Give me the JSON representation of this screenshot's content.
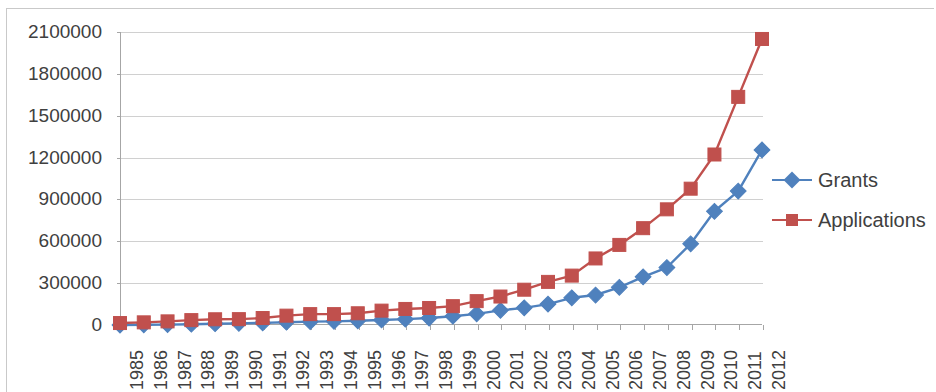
{
  "chart_data": {
    "type": "line",
    "title": "",
    "subtitle": "",
    "xlabel": "",
    "ylabel": "",
    "grid": true,
    "legend_position": "right",
    "xlim": [
      "1985",
      "2012"
    ],
    "ylim": [
      0,
      2100000
    ],
    "ytick_step": 300000,
    "categories": [
      "1985",
      "1986",
      "1987",
      "1988",
      "1989",
      "1990",
      "1991",
      "1992",
      "1993",
      "1994",
      "1995",
      "1996",
      "1997",
      "1998",
      "1999",
      "2000",
      "2001",
      "2002",
      "2003",
      "2004",
      "2005",
      "2006",
      "2007",
      "2008",
      "2009",
      "2010",
      "2011",
      "2012"
    ],
    "ytick_labels": [
      "0",
      "300000",
      "600000",
      "900000",
      "1200000",
      "1500000",
      "1800000",
      "2100000"
    ],
    "ytick_values": [
      0,
      300000,
      600000,
      900000,
      1200000,
      1500000,
      1800000,
      2100000
    ],
    "series": [
      {
        "name": "Grants",
        "color": "#4F81BD",
        "marker": "diamond",
        "values": [
          1,
          1500,
          3000,
          5500,
          9000,
          12000,
          15000,
          20000,
          24000,
          26000,
          30000,
          36000,
          42000,
          50000,
          63000,
          80000,
          105000,
          123000,
          150000,
          195000,
          215000,
          270000,
          345000,
          412000,
          582000,
          815000,
          960000,
          1255000
        ]
      },
      {
        "name": "Applications",
        "color": "#C0504D",
        "marker": "square",
        "values": [
          14000,
          19000,
          26000,
          35000,
          41000,
          42000,
          50000,
          67000,
          78000,
          78000,
          84000,
          103000,
          115000,
          122000,
          135000,
          171000,
          204000,
          253000,
          309000,
          354000,
          477000,
          574000,
          694000,
          829000,
          977000,
          1222000,
          1635000,
          2050000
        ]
      }
    ]
  },
  "legend": {
    "items": [
      {
        "label": "Grants",
        "color": "#4F81BD",
        "marker": "diamond"
      },
      {
        "label": "Applications",
        "color": "#C0504D",
        "marker": "square"
      }
    ]
  }
}
